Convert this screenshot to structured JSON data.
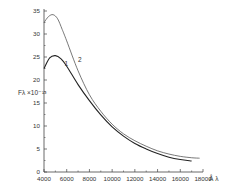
{
  "chart_data": {
    "type": "line",
    "title": "",
    "xlabel": "Å λ",
    "ylabel": "Fλ ×10⁻¹³",
    "xlim": [
      4000,
      18000
    ],
    "ylim": [
      0,
      35
    ],
    "grid": false,
    "legend": "none (curves labeled inline 1 and 2)",
    "x_ticks": [
      "4000",
      "6000",
      "8000",
      "10000",
      "12000",
      "14000",
      "16000",
      "18000"
    ],
    "y_ticks": [
      "0",
      "5",
      "10",
      "15",
      "20",
      "25",
      "30",
      "35"
    ],
    "series": [
      {
        "name": "1",
        "x": [
          4000,
          4500,
          5000,
          5500,
          6000,
          7000,
          8000,
          9000,
          10000,
          11000,
          12000,
          13000,
          14000,
          15000,
          16000,
          17000
        ],
        "values": [
          22.5,
          24.8,
          25.3,
          24.6,
          23.0,
          19.0,
          15.5,
          12.4,
          9.8,
          7.8,
          6.2,
          5.0,
          4.0,
          3.2,
          2.7,
          2.4
        ]
      },
      {
        "name": "2",
        "x": [
          4000,
          4400,
          4800,
          5200,
          5600,
          6000,
          7000,
          8000,
          9000,
          10000,
          11000,
          12000,
          13000,
          14000,
          15000,
          16000,
          17000,
          17700
        ],
        "values": [
          32.5,
          33.8,
          34.2,
          33.3,
          31.0,
          28.5,
          22.0,
          16.8,
          13.2,
          10.4,
          8.3,
          6.8,
          5.6,
          4.6,
          3.9,
          3.4,
          3.1,
          3.0
        ]
      }
    ],
    "annotations": [
      {
        "text": "1",
        "near_x": 5800,
        "near_y": 23
      },
      {
        "text": "2",
        "near_x": 7000,
        "near_y": 24
      }
    ]
  }
}
